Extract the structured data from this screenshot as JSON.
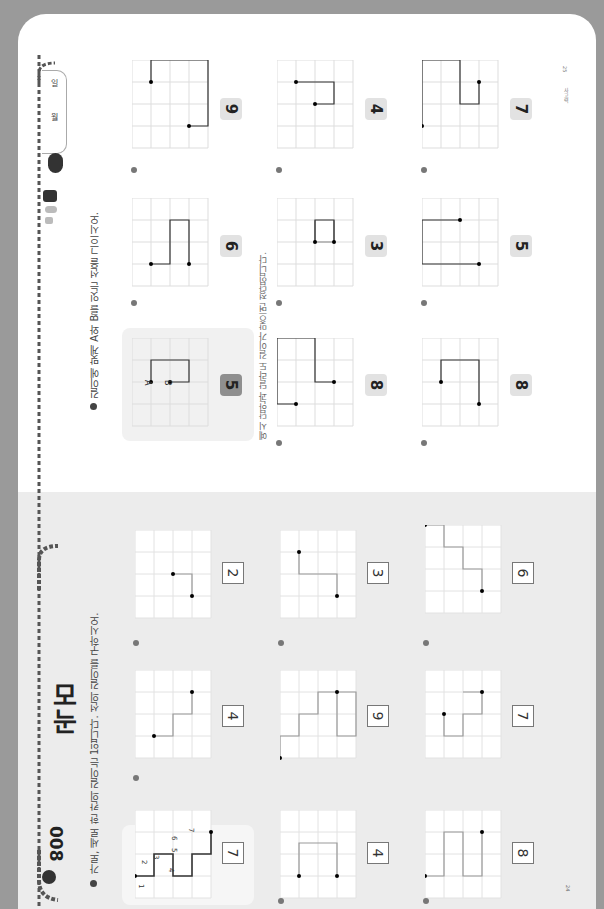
{
  "header": {
    "lesson_number": "008",
    "title": "모눈",
    "instruction_1": "가로, 세로 한 칸의 길이는 1입니다. 선의 길이를 구하시오.",
    "instruction_2": "길이에 맞게 A와 B를 잇는 선을 그으시오.",
    "note": "예시 답안과 달라도 길이가 맞으면 정답입니다."
  },
  "date_tab": {
    "month_label": "월",
    "day_label": "일"
  },
  "footer": {
    "left_page_number": "24",
    "right_page_label": "사고력",
    "right_page_number": "25"
  },
  "point_labels": {
    "a": "A",
    "b": "B"
  },
  "left_page": {
    "example": {
      "answer": "7",
      "segment_labels": [
        "1",
        "2",
        "3",
        "4",
        "5",
        "6",
        "7"
      ]
    },
    "problems": [
      {
        "id": "1",
        "answer": "4",
        "segment_labels": [
          "1",
          "2",
          "3",
          "4"
        ]
      },
      {
        "id": "2",
        "answer": "2",
        "segment_labels": [
          "1",
          "2"
        ]
      },
      {
        "id": "3",
        "answer": "4"
      },
      {
        "id": "4",
        "answer": "9"
      },
      {
        "id": "5",
        "answer": "3"
      },
      {
        "id": "6",
        "answer": "8"
      },
      {
        "id": "7",
        "answer": "7"
      },
      {
        "id": "8",
        "answer": "6"
      }
    ]
  },
  "right_page": {
    "example": {
      "length": "5"
    },
    "problems": [
      {
        "id": "1",
        "length": "6"
      },
      {
        "id": "2",
        "length": "8"
      },
      {
        "id": "3",
        "length": "8"
      },
      {
        "id": "4",
        "length": "3"
      },
      {
        "id": "5",
        "length": "5"
      },
      {
        "id": "6",
        "length": "4"
      },
      {
        "id": "7",
        "length": "7"
      },
      {
        "id": "8",
        "length": "9"
      }
    ]
  },
  "colors": {
    "page_bg": "#ffffff",
    "left_page_bg": "#ececec",
    "border": "#9a9a9a",
    "line_dark": "#333333",
    "line_light": "#999999",
    "badge": "#e2e2e2",
    "badge_dark": "#8f8f8f"
  }
}
